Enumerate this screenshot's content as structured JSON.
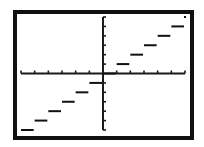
{
  "chart_data": {
    "type": "line",
    "title": "",
    "subtitle": "",
    "function": "y = floor(x)",
    "xlabel": "",
    "ylabel": "",
    "xlim": [
      -6,
      6
    ],
    "ylim": [
      -6,
      6
    ],
    "x_ticks": [
      -6,
      -5,
      -4,
      -3,
      -2,
      -1,
      0,
      1,
      2,
      3,
      4,
      5,
      6
    ],
    "y_ticks": [
      -6,
      -5,
      -4,
      -3,
      -2,
      -1,
      0,
      1,
      2,
      3,
      4,
      5,
      6
    ],
    "tick_labels_shown": false,
    "grid": false,
    "legend": null,
    "series": [
      {
        "name": "greatest integer function",
        "style": "step segments",
        "segments": [
          {
            "x_start": -6,
            "x_end": -5,
            "y": -6
          },
          {
            "x_start": -5,
            "x_end": -4,
            "y": -5
          },
          {
            "x_start": -4,
            "x_end": -3,
            "y": -4
          },
          {
            "x_start": -3,
            "x_end": -2,
            "y": -3
          },
          {
            "x_start": -2,
            "x_end": -1,
            "y": -2
          },
          {
            "x_start": -1,
            "x_end": 0,
            "y": -1
          },
          {
            "x_start": 0,
            "x_end": 1,
            "y": 0
          },
          {
            "x_start": 1,
            "x_end": 2,
            "y": 1
          },
          {
            "x_start": 2,
            "x_end": 3,
            "y": 2
          },
          {
            "x_start": 3,
            "x_end": 4,
            "y": 3
          },
          {
            "x_start": 4,
            "x_end": 5,
            "y": 4
          },
          {
            "x_start": 5,
            "x_end": 6,
            "y": 5
          }
        ],
        "points": [
          {
            "x": 6,
            "y": 6
          }
        ]
      }
    ]
  },
  "colors": {
    "frame": "#111111",
    "axes": "#1a1a1a",
    "plot": "#111111",
    "background": "#ffffff"
  }
}
